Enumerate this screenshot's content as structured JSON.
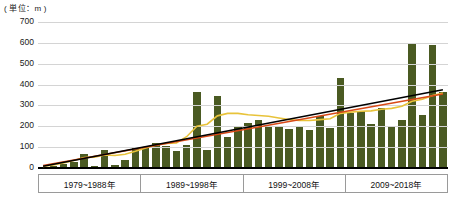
{
  "chart_data": {
    "type": "bar",
    "title": "",
    "unit_label": "( 単位：m )",
    "xlabel": "",
    "ylabel": "",
    "ylim": [
      0,
      700
    ],
    "ytick_values": [
      0,
      100,
      200,
      300,
      400,
      500,
      600,
      700
    ],
    "ytick_labels": [
      "0",
      "100",
      "200",
      "300",
      "400",
      "500",
      "600",
      "700"
    ],
    "grid": true,
    "legend_position": "none",
    "bar_color": "#4a5a22",
    "categories": [
      "1979",
      "1980",
      "1981",
      "1982",
      "1983",
      "1984",
      "1985",
      "1986",
      "1987",
      "1988",
      "1989",
      "1990",
      "1991",
      "1992",
      "1993",
      "1994",
      "1995",
      "1996",
      "1997",
      "1998",
      "1999",
      "2000",
      "2001",
      "2002",
      "2003",
      "2004",
      "2005",
      "2006",
      "2007",
      "2008",
      "2009",
      "2010",
      "2011",
      "2012",
      "2013",
      "2014",
      "2015",
      "2016",
      "2017",
      "2018"
    ],
    "values": [
      5,
      10,
      20,
      30,
      65,
      10,
      85,
      15,
      40,
      95,
      100,
      120,
      105,
      80,
      110,
      365,
      85,
      345,
      150,
      200,
      215,
      230,
      200,
      200,
      185,
      195,
      180,
      250,
      190,
      430,
      265,
      275,
      210,
      290,
      200,
      230,
      595,
      255,
      590,
      365
    ],
    "group_boxes": [
      {
        "label": "1979~1988年",
        "start": 0,
        "end": 9
      },
      {
        "label": "1989~1998年",
        "start": 10,
        "end": 19
      },
      {
        "label": "1999~2008年",
        "start": 20,
        "end": 29
      },
      {
        "label": "2009~2018年",
        "start": 30,
        "end": 39
      }
    ],
    "series": [
      {
        "name": "bars",
        "type": "bar",
        "color": "#4a5a22",
        "values": [
          5,
          10,
          20,
          30,
          65,
          10,
          85,
          15,
          40,
          95,
          100,
          120,
          105,
          80,
          110,
          365,
          85,
          345,
          150,
          200,
          215,
          230,
          200,
          200,
          185,
          195,
          180,
          250,
          190,
          430,
          265,
          275,
          210,
          290,
          200,
          230,
          595,
          255,
          590,
          365
        ]
      },
      {
        "name": "trend-line-black",
        "type": "line",
        "color": "#000000",
        "style": "straight",
        "endpoints": [
          {
            "x": 0,
            "y": 8
          },
          {
            "x": 39,
            "y": 375
          }
        ]
      },
      {
        "name": "trend-line-red",
        "type": "line",
        "color": "#d94a18",
        "style": "straight",
        "endpoints": [
          {
            "x": 0,
            "y": 12
          },
          {
            "x": 39,
            "y": 355
          }
        ]
      },
      {
        "name": "moving-average-yellow",
        "type": "line",
        "color": "#e8c33a",
        "style": "smoothed",
        "values": [
          8,
          14,
          24,
          36,
          50,
          52,
          62,
          60,
          66,
          80,
          96,
          110,
          118,
          120,
          150,
          200,
          210,
          250,
          262,
          262,
          255,
          252,
          248,
          240,
          232,
          228,
          228,
          232,
          236,
          262,
          268,
          272,
          274,
          282,
          286,
          296,
          320,
          330,
          348,
          360
        ]
      }
    ]
  },
  "axis": {
    "unit": "( 単位：m )"
  }
}
